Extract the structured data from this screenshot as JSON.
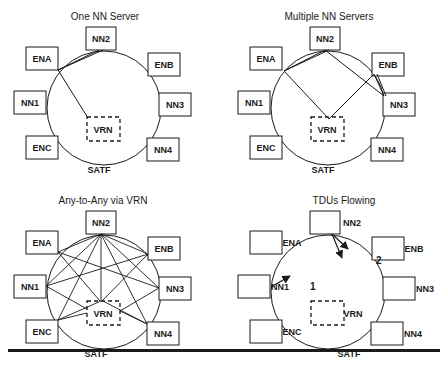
{
  "panels": [
    {
      "id": "one-nn-server",
      "title": "One NN Server",
      "offset": [
        0,
        0
      ],
      "ring_label": "SATF",
      "nodes": [
        "NN2",
        "ENA",
        "ENB",
        "NN1",
        "NN3",
        "ENC",
        "NN4"
      ],
      "vrn_label": "VRN"
    },
    {
      "id": "multiple-nn-servers",
      "title": "Multiple NN Servers",
      "offset": [
        224,
        0
      ],
      "ring_label": "SATF",
      "nodes": [
        "NN2",
        "ENA",
        "ENB",
        "NN1",
        "NN3",
        "ENC",
        "NN4"
      ],
      "vrn_label": "VRN"
    },
    {
      "id": "any-to-any-via-vrn",
      "title": "Any-to-Any via VRN",
      "offset": [
        0,
        184
      ],
      "ring_label": "SATF",
      "nodes": [
        "NN2",
        "ENA",
        "ENB",
        "NN1",
        "NN3",
        "ENC",
        "NN4"
      ],
      "vrn_label": "VRN"
    },
    {
      "id": "tdus-flowing",
      "title": "TDUs Flowing",
      "offset": [
        224,
        184
      ],
      "ring_label": "SATF",
      "nodes": [
        "NN2",
        "ENA",
        "ENB",
        "NN1",
        "NN3",
        "ENC",
        "NN4"
      ],
      "vrn_label": "VRN",
      "flow_labels": [
        "1",
        "2"
      ]
    }
  ],
  "colors": {
    "stroke": "#1a1a1a",
    "background": "#ffffff"
  }
}
